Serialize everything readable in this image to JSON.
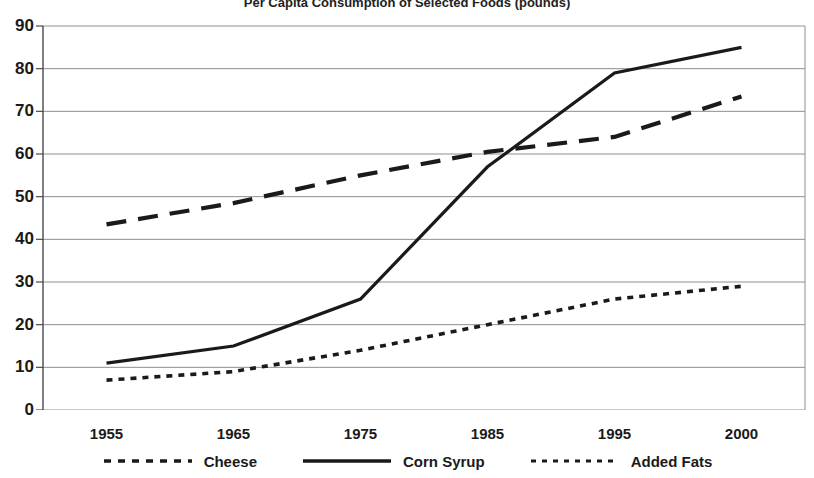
{
  "chart_data": {
    "type": "line",
    "title": "Per Capita Consumption of Selected Foods (pounds)",
    "xlabel": "",
    "ylabel": "",
    "x": [
      1955,
      1965,
      1975,
      1985,
      1995,
      2000
    ],
    "categories": [
      "1955",
      "1965",
      "1975",
      "1985",
      "1995",
      "2000"
    ],
    "xtick_labels": [
      "1955",
      "1965",
      "1975",
      "1985",
      "1995",
      "2000"
    ],
    "ytick_labels": [
      "0",
      "10",
      "20",
      "30",
      "40",
      "50",
      "60",
      "70",
      "80",
      "90"
    ],
    "yticks": [
      0,
      10,
      20,
      30,
      40,
      50,
      60,
      70,
      80,
      90
    ],
    "ylim": [
      0,
      90
    ],
    "grid": "horizontal",
    "legend_position": "bottom",
    "series": [
      {
        "name": "Cheese",
        "style": "dotted",
        "values": [
          7,
          9,
          14,
          20,
          26,
          29
        ]
      },
      {
        "name": "Corn Syrup",
        "style": "solid",
        "values": [
          11,
          15,
          26,
          57,
          79,
          85
        ]
      },
      {
        "name": "Added Fats",
        "style": "dashed",
        "values": [
          43.5,
          48.5,
          55,
          60.5,
          64,
          73.5
        ]
      }
    ]
  },
  "legend": {
    "items": [
      {
        "label": "Cheese",
        "swatch": "dotted-line-swatch"
      },
      {
        "label": "Corn Syrup",
        "swatch": "solid-line-swatch"
      },
      {
        "label": "Added Fats",
        "swatch": "dotted-line-swatch"
      }
    ]
  },
  "colors": {
    "line": "#1a1a1a",
    "grid": "#8f8f8f",
    "axis": "#4a4a4a",
    "text": "#1a1a1a",
    "background": "#ffffff"
  }
}
